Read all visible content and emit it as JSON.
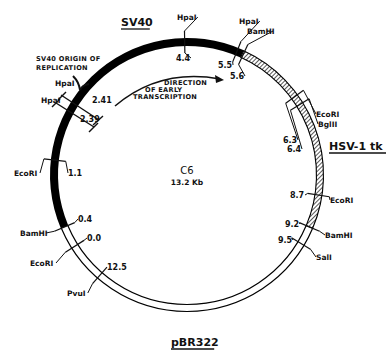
{
  "plasmid": {
    "name": "C6",
    "size_label": "13.2 Kb",
    "total_kb": 13.2
  },
  "geometry": {
    "cx": 187,
    "cy": 175,
    "r": 133,
    "band_width": 7
  },
  "segments": [
    {
      "name": "SV40",
      "style": "solid",
      "color": "#000000",
      "start_angle": 157,
      "end_angle": 294.5
    },
    {
      "name": "HSV-1 tk",
      "style": "hatched",
      "color": "#000000",
      "start_angle": 294.5,
      "end_angle": 383
    },
    {
      "name": "pBR322",
      "style": "double",
      "color": "#000000",
      "start_angle": 23,
      "end_angle": 157
    }
  ],
  "region_labels": {
    "sv40": {
      "text": "SV40",
      "x": 121,
      "y": 26
    },
    "hsv": {
      "text": "HSV-1 tk",
      "x": 329,
      "y": 150
    },
    "pbr": {
      "text": "pBR322",
      "x": 171,
      "y": 346
    }
  },
  "sites": [
    {
      "enzyme": "EcoRI",
      "pos": "0.0",
      "angle": 147.6,
      "enz_x": 30,
      "enz_y": 266,
      "pos_x": 87,
      "pos_y": 241
    },
    {
      "enzyme": "BamHI",
      "pos": "0.4",
      "angle": 157,
      "enz_x": 20,
      "enz_y": 236,
      "pos_x": 78,
      "pos_y": 222
    },
    {
      "enzyme": "EcoRI",
      "pos": "1.1",
      "angle": 186.4,
      "enz_x": 14,
      "enz_y": 176,
      "pos_x": 68,
      "pos_y": 176
    },
    {
      "enzyme": "HpaI",
      "pos": "4.4",
      "angle": 269,
      "enz_x": 177,
      "enz_y": 20,
      "pos_x": 176,
      "pos_y": 61
    },
    {
      "enzyme": "HpaI",
      "pos": "5.5",
      "angle": 292,
      "enz_x": 239,
      "enz_y": 24,
      "pos_x": 218,
      "pos_y": 68
    },
    {
      "enzyme": "BamHI",
      "pos": "5.6",
      "angle": 295,
      "enz_x": 247,
      "enz_y": 34,
      "pos_x": 230,
      "pos_y": 79
    },
    {
      "enzyme": "EcoRI",
      "pos": "6.3",
      "angle": 324,
      "enz_x": 316,
      "enz_y": 117,
      "pos_x": 283,
      "pos_y": 143
    },
    {
      "enzyme": "BglII",
      "pos": "6.4",
      "angle": 328,
      "enz_x": 318,
      "enz_y": 127,
      "pos_x": 287,
      "pos_y": 152
    },
    {
      "enzyme": "EcoRI",
      "pos": "8.7",
      "angle": 8.7,
      "enz_x": 330,
      "enz_y": 203,
      "pos_x": 290,
      "pos_y": 198
    },
    {
      "enzyme": "BamHI",
      "pos": "9.2",
      "angle": 23,
      "enz_x": 325,
      "enz_y": 238,
      "pos_x": 285,
      "pos_y": 227
    },
    {
      "enzyme": "SalI",
      "pos": "9.5",
      "angle": 31,
      "enz_x": 316,
      "enz_y": 260,
      "pos_x": 278,
      "pos_y": 243
    },
    {
      "enzyme": "PvuI",
      "pos": "12.5",
      "angle": 131,
      "enz_x": 67,
      "enz_y": 296,
      "pos_x": 107,
      "pos_y": 270
    }
  ],
  "origin": {
    "title_line1": "SV40 ORIGIN OF",
    "title_line2": "REPLICATION",
    "hpa1": {
      "enzyme": "HpaI",
      "pos": "2.41"
    },
    "hpa2": {
      "enzyme": "HpaI",
      "pos": "2.39"
    }
  },
  "transcription_arrow": {
    "line1": "DIRECTION",
    "line2": "OF EARLY",
    "line3": "TRANSCRIPTION"
  }
}
